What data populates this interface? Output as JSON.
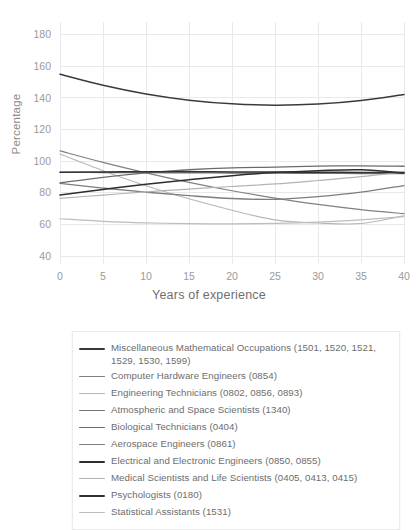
{
  "chart_data": {
    "type": "line",
    "title": "",
    "xlabel": "Years of experience",
    "ylabel": "Percentage",
    "xlim": [
      0,
      40
    ],
    "ylim": [
      35,
      188
    ],
    "xticks": [
      0,
      5,
      10,
      15,
      20,
      25,
      30,
      35,
      40
    ],
    "yticks": [
      40,
      60,
      80,
      100,
      120,
      140,
      160,
      180
    ],
    "grid": true,
    "legend_position": "below",
    "x": [
      0,
      5,
      10,
      15,
      20,
      25,
      30,
      35,
      40
    ],
    "series": [
      {
        "name": "Miscellaneous Mathematical Occupations (1501, 1520, 1521, 1529, 1530, 1599)",
        "color": "#3a3a3a",
        "width": 1.5,
        "values": [
          155.0,
          148.0,
          142.5,
          138.6,
          136.3,
          135.4,
          136.1,
          138.4,
          142.2
        ]
      },
      {
        "name": "Computer Hardware Engineers (0854)",
        "color": "#808080",
        "width": 1.2,
        "values": [
          106.5,
          99.2,
          92.6,
          86.6,
          81.3,
          76.7,
          72.7,
          69.4,
          66.8
        ]
      },
      {
        "name": "Engineering Technicians (0802, 0856, 0893)",
        "color": "#b6b6b6",
        "width": 1.1,
        "values": [
          104.5,
          94.0,
          84.5,
          76.2,
          69.0,
          62.9,
          60.9,
          60.6,
          65.5
        ]
      },
      {
        "name": "Atmospheric and Space Scientists (1340)",
        "color": "#737373",
        "width": 1.2,
        "values": [
          92.9,
          92.8,
          92.7,
          92.6,
          92.5,
          92.4,
          92.3,
          92.2,
          92.1
        ]
      },
      {
        "name": "Biological Technicians (0404)",
        "color": "#6b6b6b",
        "width": 1.3,
        "values": [
          86.3,
          89.8,
          92.6,
          94.6,
          95.8,
          96.3,
          96.9,
          97.1,
          96.8
        ]
      },
      {
        "name": "Aerospace Engineers (0861)",
        "color": "#7d7d7d",
        "width": 1.3,
        "values": [
          86.0,
          83.0,
          80.4,
          78.2,
          76.4,
          75.9,
          77.6,
          80.4,
          84.6
        ]
      },
      {
        "name": "Electrical and Electronic Engineers (0850, 0855)",
        "color": "#2e2e2e",
        "width": 1.5,
        "values": [
          78.6,
          82.1,
          85.4,
          88.3,
          90.8,
          92.8,
          94.0,
          94.6,
          92.6
        ]
      },
      {
        "name": "Medical Scientists and Life Scientists (0405, 0413, 0415)",
        "color": "#b3b3b3",
        "width": 1.2,
        "values": [
          76.5,
          78.6,
          80.6,
          82.4,
          84.0,
          85.6,
          87.8,
          90.2,
          93.2
        ]
      },
      {
        "name": "Psychologists (0180)",
        "color": "#313131",
        "width": 1.5,
        "values": [
          93.0,
          93.2,
          93.3,
          93.3,
          93.2,
          93.1,
          93.0,
          92.9,
          92.8
        ]
      },
      {
        "name": "Statistical Assistants (1531)",
        "color": "#bdbdbd",
        "width": 1.2,
        "values": [
          63.6,
          62.0,
          61.0,
          60.5,
          60.4,
          60.7,
          61.5,
          62.9,
          64.9
        ]
      }
    ]
  }
}
